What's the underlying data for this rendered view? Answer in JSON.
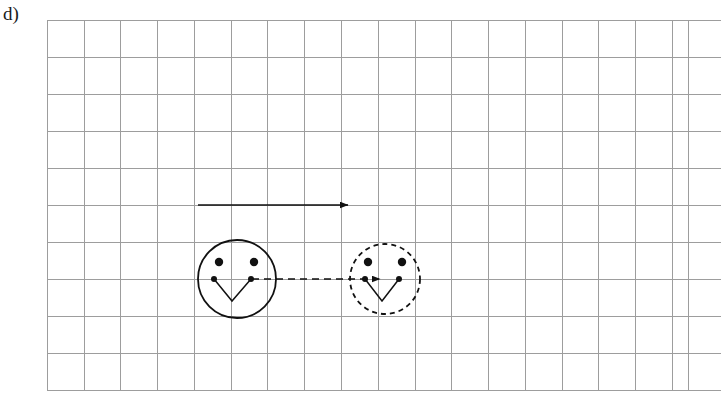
{
  "figure": {
    "part_label": "d)",
    "background_color": "#ffffff",
    "width": 721,
    "height": 401
  },
  "grid": {
    "name": "graph-paper-grid",
    "line_color": "#9d9d9d",
    "line_width": 1,
    "cell_size": 36.8,
    "left": 47,
    "top": 20,
    "bottom": 390,
    "right_clipped_at": 721,
    "last_full_vertical_line_x": 688,
    "columns": 18,
    "rows": 10,
    "vertical_line_positions": [
      47,
      84,
      120,
      157,
      194,
      231,
      267,
      304,
      341,
      378,
      415,
      451,
      488,
      525,
      562,
      598,
      635,
      672,
      688
    ],
    "horizontal_line_positions": [
      20,
      57,
      94,
      131,
      168,
      205,
      242,
      279,
      316,
      353,
      390
    ]
  },
  "objects": {
    "stroke_color": "#111111",
    "top_arrow": {
      "name": "displacement-arrow",
      "label": "",
      "start_x": 198,
      "start_y": 205,
      "end_x": 348,
      "end_y": 205,
      "line_style": "solid",
      "line_width": 1.6,
      "arrowhead": "end",
      "length_cells": 4
    },
    "connector_arrow": {
      "name": "motion-path-arrow",
      "label": "",
      "start_x": 252,
      "start_y": 279,
      "end_x": 380,
      "end_y": 279,
      "line_style": "dashed",
      "dash_pattern": "7,5",
      "line_width": 1.6,
      "arrowhead": "end",
      "length_cells": 3.5
    },
    "face_initial": {
      "name": "smiley-face-initial-position",
      "label": "",
      "center_x": 237,
      "center_y": 279,
      "radius": 39,
      "outline_style": "solid",
      "outline_width": 1.8,
      "eyes": [
        {
          "cx": 219,
          "cy": 262,
          "r": 4.2
        },
        {
          "cx": 254,
          "cy": 262,
          "r": 4.2
        }
      ],
      "mouth": {
        "left_dot": {
          "cx": 214,
          "cy": 279,
          "r": 3.0
        },
        "right_dot": {
          "cx": 251,
          "cy": 279,
          "r": 3.0
        },
        "vertex_x": 232,
        "vertex_y": 301,
        "line_width": 1.5
      }
    },
    "face_final": {
      "name": "smiley-face-final-position",
      "label": "",
      "center_x": 385,
      "center_y": 279,
      "radius": 35,
      "outline_style": "dashed",
      "outline_dash_pattern": "5,4",
      "outline_width": 1.8,
      "eyes": [
        {
          "cx": 368,
          "cy": 262,
          "r": 4.2
        },
        {
          "cx": 402,
          "cy": 262,
          "r": 4.2
        }
      ],
      "mouth": {
        "left_dot": {
          "cx": 365,
          "cy": 279,
          "r": 3.0
        },
        "right_dot": {
          "cx": 399,
          "cy": 279,
          "r": 3.0
        },
        "vertex_x": 382,
        "vertex_y": 301,
        "line_width": 1.5
      }
    }
  }
}
